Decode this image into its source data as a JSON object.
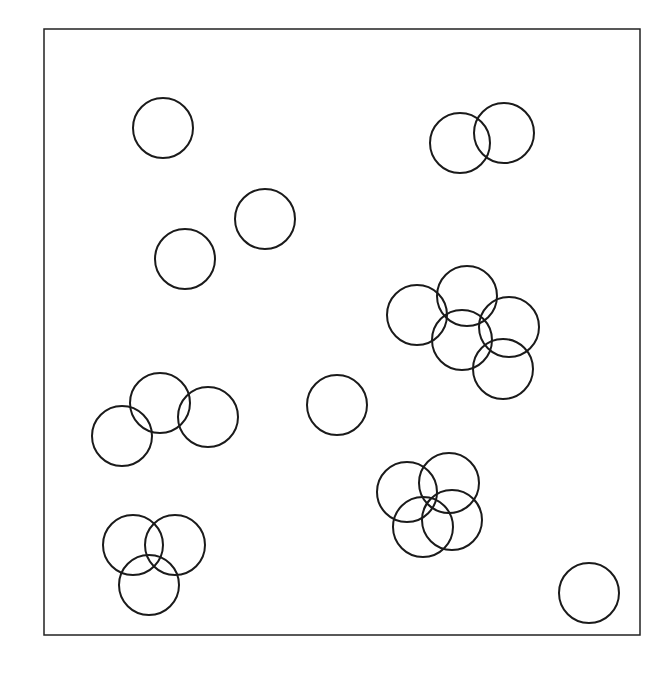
{
  "diagram": {
    "type": "circle-placement",
    "frame": {
      "x1": 44,
      "y1": 29,
      "x2": 640,
      "y2": 635,
      "stroke": "#222222"
    },
    "circle_radius": 30,
    "stroke_color": "#1a1a1a",
    "background": "#ffffff",
    "circles": [
      {
        "cx": 163,
        "cy": 128
      },
      {
        "cx": 265,
        "cy": 219
      },
      {
        "cx": 185,
        "cy": 259
      },
      {
        "cx": 460,
        "cy": 143
      },
      {
        "cx": 504,
        "cy": 133
      },
      {
        "cx": 417,
        "cy": 315
      },
      {
        "cx": 467,
        "cy": 296
      },
      {
        "cx": 462,
        "cy": 340
      },
      {
        "cx": 509,
        "cy": 327
      },
      {
        "cx": 503,
        "cy": 369
      },
      {
        "cx": 122,
        "cy": 436
      },
      {
        "cx": 160,
        "cy": 403
      },
      {
        "cx": 208,
        "cy": 417
      },
      {
        "cx": 337,
        "cy": 405
      },
      {
        "cx": 407,
        "cy": 492
      },
      {
        "cx": 449,
        "cy": 483
      },
      {
        "cx": 423,
        "cy": 527
      },
      {
        "cx": 452,
        "cy": 520
      },
      {
        "cx": 133,
        "cy": 545
      },
      {
        "cx": 175,
        "cy": 545
      },
      {
        "cx": 149,
        "cy": 585
      },
      {
        "cx": 589,
        "cy": 593
      }
    ]
  }
}
